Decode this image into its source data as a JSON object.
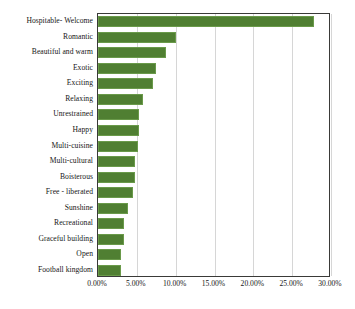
{
  "chart_data": {
    "type": "bar",
    "orientation": "horizontal",
    "title": "",
    "xlabel": "",
    "ylabel": "",
    "categories": [
      "Hospitable- Welcome",
      "Romantic",
      "Beautiful and warm",
      "Exotic",
      "Exciting",
      "Relaxing",
      "Unrestrained",
      "Happy",
      "Multi-cuisine",
      "Multi-cultural",
      "Boisterous",
      "Free - liberated",
      "Sunshine",
      "Recreational",
      "Graceful building",
      "Open",
      "Football kingdom"
    ],
    "values": [
      27.8,
      10.0,
      8.7,
      7.5,
      7.1,
      5.8,
      5.3,
      5.3,
      5.1,
      4.8,
      4.8,
      4.5,
      3.9,
      3.4,
      3.3,
      2.9,
      2.9
    ],
    "value_format": "percent",
    "xlim": [
      0,
      30
    ],
    "xticks": [
      0,
      5,
      10,
      15,
      20,
      25,
      30
    ],
    "xtick_labels": [
      "0.00%",
      "5.00%",
      "10.00%",
      "15.00%",
      "20.00%",
      "25.00%",
      "30.00%"
    ],
    "grid": true,
    "grid_axis": "x",
    "legend": false,
    "series_color": "#507f32",
    "bar_edge_color": "#6a9a4a",
    "plot_border_color": "#3a3a38",
    "gridline_color": "#d6d6d6"
  }
}
